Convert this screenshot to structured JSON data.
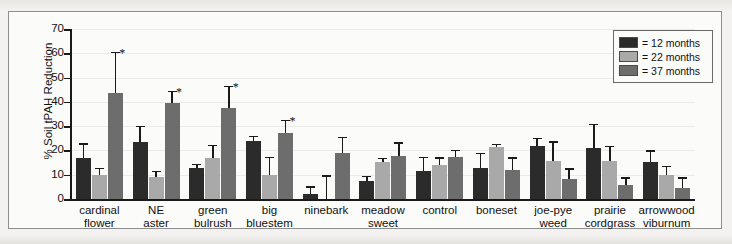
{
  "chart_data": {
    "type": "bar",
    "title": "",
    "xlabel": "",
    "ylabel": "% Soil tPAH Reduction",
    "ylim": [
      0,
      70
    ],
    "ytick_labels": [
      "70",
      "60",
      "50",
      "40",
      "30",
      "20",
      "10",
      "0"
    ],
    "ytick_values": [
      70,
      60,
      50,
      40,
      30,
      20,
      10,
      0
    ],
    "grid": true,
    "legend_position": "top-right",
    "categories": [
      "cardinal flower",
      "NE aster",
      "green bulrush",
      "big bluestem",
      "ninebark",
      "meadow sweet",
      "control",
      "boneset",
      "joe-pye weed",
      "prairie cordgrass",
      "arrowwood viburnum"
    ],
    "category_lines": [
      [
        "cardinal",
        "flower"
      ],
      [
        "NE",
        "aster"
      ],
      [
        "green",
        "bulrush"
      ],
      [
        "big",
        "bluestem"
      ],
      [
        "ninebark",
        ""
      ],
      [
        "meadow",
        "sweet"
      ],
      [
        "control",
        ""
      ],
      [
        "boneset",
        ""
      ],
      [
        "joe-pye",
        "weed"
      ],
      [
        "prairie",
        "cordgrass"
      ],
      [
        "arrowwood",
        "viburnum"
      ]
    ],
    "series": [
      {
        "name": "12 months",
        "color": "#2b2b2b",
        "values": [
          17.0,
          23.4,
          12.8,
          24.0,
          2.0,
          7.3,
          11.7,
          12.7,
          22.0,
          21.0,
          15.2
        ],
        "errors": [
          6.0,
          6.7,
          1.6,
          1.9,
          3.2,
          2.3,
          5.7,
          6.3,
          3.2,
          10.0,
          4.8
        ]
      },
      {
        "name": "22 months",
        "color": "#a9a9a9",
        "values": [
          9.8,
          9.2,
          17.0,
          9.9,
          0.0,
          15.3,
          14.2,
          21.3,
          15.5,
          15.8,
          9.7
        ],
        "errors": [
          3.0,
          2.4,
          5.3,
          7.5,
          9.8,
          1.7,
          3.0,
          1.4,
          8.2,
          6.1,
          4.0
        ]
      },
      {
        "name": "37 months",
        "color": "#6d6d6d",
        "values": [
          43.5,
          39.6,
          37.3,
          27.0,
          19.0,
          17.7,
          17.2,
          12.1,
          8.2,
          5.7,
          4.5
        ]
      }
    ],
    "series37_errors": [
      17.0,
      5.0,
      9.3,
      5.5,
      6.5,
      5.7,
      3.0,
      5.0,
      4.5,
      3.3,
      4.5
    ],
    "significance_marker": "*",
    "significance_groups": [
      "cardinal flower",
      "NE aster",
      "green bulrush",
      "big bluestem"
    ],
    "significance_series": "37 months"
  },
  "legend": {
    "items": [
      {
        "label": "= 12 months",
        "color": "#2b2b2b"
      },
      {
        "label": "= 22 months",
        "color": "#a9a9a9"
      },
      {
        "label": "= 37 months",
        "color": "#6d6d6d"
      }
    ]
  }
}
